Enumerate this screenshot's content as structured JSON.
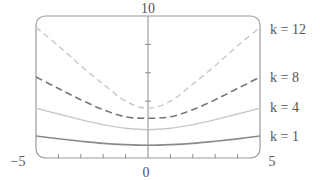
{
  "chart_data": {
    "type": "line",
    "title": "",
    "xlabel": "",
    "ylabel": "",
    "xlim": [
      -5,
      5
    ],
    "ylim": [
      0,
      10
    ],
    "x_tick_labels": [
      "-5",
      "0",
      "5"
    ],
    "y_tick_labels": [
      "10"
    ],
    "x_minor_ticks": [
      -4,
      -3,
      -2,
      -1,
      1,
      2,
      3,
      4
    ],
    "y_minor_ticks": [
      2,
      4,
      6,
      8
    ],
    "grid": false,
    "legend_position": "right (inline labels)",
    "x": [
      -5,
      -4,
      -3,
      -2,
      -1,
      0,
      1,
      2,
      3,
      4,
      5
    ],
    "series": [
      {
        "name": "k = 12",
        "label": "k = 12",
        "style": "dashed-light",
        "color": "#c8c8c8",
        "values": [
          9.2,
          7.9,
          6.5,
          5.2,
          4.0,
          3.5,
          4.0,
          5.2,
          6.5,
          7.9,
          9.2
        ]
      },
      {
        "name": "k = 8",
        "label": "k = 8",
        "style": "dashed",
        "color": "#777777",
        "values": [
          5.7,
          4.9,
          4.1,
          3.4,
          2.9,
          2.8,
          2.9,
          3.4,
          4.1,
          4.9,
          5.7
        ]
      },
      {
        "name": "k = 4",
        "label": "k = 4",
        "style": "solid-light",
        "color": "#c8c8c8",
        "values": [
          3.5,
          3.1,
          2.7,
          2.35,
          2.1,
          2.0,
          2.1,
          2.35,
          2.7,
          3.1,
          3.5
        ]
      },
      {
        "name": "k = 1",
        "label": "k = 1",
        "style": "solid",
        "color": "#8a8a8a",
        "values": [
          1.55,
          1.35,
          1.18,
          1.03,
          0.94,
          0.9,
          0.94,
          1.03,
          1.18,
          1.35,
          1.55
        ]
      }
    ]
  },
  "labels": {
    "y_top": "10",
    "x_left": "−5",
    "x_zero": "0",
    "x_right": "5",
    "k12": "k = 12",
    "k8": "k = 8",
    "k4": "k = 4",
    "k1": "k = 1"
  }
}
